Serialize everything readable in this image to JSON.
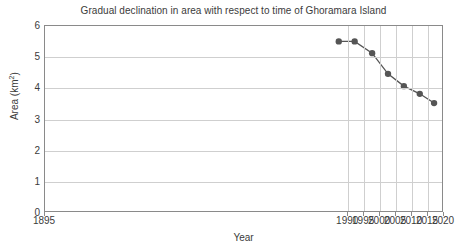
{
  "chart_data": {
    "type": "line",
    "title": "Gradual declination in area with respect to time of Ghoramara Island",
    "xlabel": "Year",
    "ylabel": "Area (km²)",
    "xlim": [
      1895,
      2020
    ],
    "ylim": [
      0,
      6
    ],
    "grid": true,
    "legend": "none",
    "xticks": [
      1895,
      1990,
      1995,
      2000,
      2005,
      2010,
      2015,
      2020
    ],
    "xtick_labels": [
      "1895",
      "1990",
      "1995",
      "2000",
      "2005",
      "2010",
      "2015",
      "2020"
    ],
    "yticks": [
      0,
      1,
      2,
      3,
      4,
      5,
      6
    ],
    "ytick_labels": [
      "0",
      "1",
      "2",
      "3",
      "4",
      "5",
      "6"
    ],
    "series": [
      {
        "name": "Area of Ghoramara Island",
        "marker": "circle",
        "color": "#555555",
        "x": [
          1987.5,
          1992.5,
          1998,
          2003,
          2008,
          2013,
          2017.5
        ],
        "values": [
          5.5,
          5.5,
          5.12,
          4.45,
          4.05,
          3.8,
          3.5
        ]
      }
    ]
  },
  "axis": {
    "y_title": "Area (km",
    "y_title_sup": "2",
    "y_title_end": ")",
    "x_title": "Year"
  }
}
